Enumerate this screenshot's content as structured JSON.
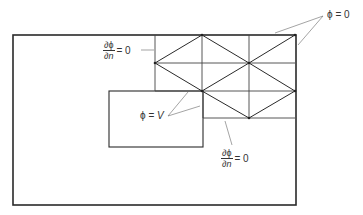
{
  "diagram": {
    "type": "finite-element mesh with boundary conditions",
    "labels": {
      "top_right": {
        "phi": "ϕ",
        "eq": "= 0"
      },
      "top_left": {
        "num": "∂ϕ",
        "den": "∂n",
        "eq": "= 0"
      },
      "inner": {
        "phi": "ϕ =",
        "var": "V"
      },
      "bottom": {
        "num": "∂ϕ",
        "den": "∂n",
        "eq": "= 0"
      }
    },
    "outer_boundary": {
      "x1": 13,
      "y1": 35,
      "x2": 296,
      "y2": 205
    },
    "inner_electrode": {
      "x1": 109,
      "y1": 91,
      "x2": 203,
      "y2": 147
    },
    "mesh": {
      "columns_x": [
        155,
        202,
        249,
        295
      ],
      "rows_y": [
        35,
        63,
        91,
        118
      ],
      "nodes": [
        [
          202,
          35
        ],
        [
          295,
          35
        ],
        [
          155,
          63
        ],
        [
          249,
          63
        ],
        [
          202,
          91
        ],
        [
          295,
          91
        ],
        [
          249,
          118
        ]
      ]
    },
    "colors": {
      "line": "#2a2a2a",
      "thin": "#555555",
      "text": "#333333"
    }
  }
}
